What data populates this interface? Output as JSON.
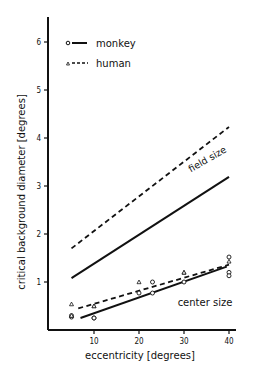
{
  "chart_data": {
    "type": "line",
    "title": "",
    "xlabel": "eccentricity  [degrees]",
    "ylabel": "critical  background  diameter  [degrees]",
    "xlim": [
      0,
      42
    ],
    "ylim": [
      0,
      6.4
    ],
    "x_ticks": [
      10,
      20,
      30,
      40
    ],
    "y_ticks": [
      1,
      2,
      3,
      4,
      5,
      6
    ],
    "grid": false,
    "legend": {
      "position": "upper left",
      "entries": [
        {
          "label": "monkey",
          "marker": "circle",
          "line": "solid"
        },
        {
          "label": "human",
          "marker": "triangle",
          "line": "dashed"
        }
      ]
    },
    "annotations": [
      {
        "text": "field size",
        "x": 35,
        "y": 3.5,
        "rotation": -27
      },
      {
        "text": "center size",
        "x": 32,
        "y": 0.7,
        "rotation": 0
      }
    ],
    "series": [
      {
        "name": "monkey field size",
        "style": "solid",
        "x": [
          5,
          40
        ],
        "y": [
          1.08,
          3.19
        ]
      },
      {
        "name": "human field size",
        "style": "dashed",
        "x": [
          5,
          40
        ],
        "y": [
          1.7,
          4.23
        ]
      },
      {
        "name": "monkey center size",
        "style": "solid",
        "x": [
          7,
          39.5
        ],
        "y": [
          0.25,
          1.32
        ]
      },
      {
        "name": "human center size",
        "style": "dashed",
        "x": [
          6.5,
          40
        ],
        "y": [
          0.45,
          1.36
        ]
      },
      {
        "name": "monkey data",
        "style": "marker-circle",
        "x": [
          5,
          5,
          10,
          10,
          20,
          23,
          23,
          30,
          40,
          40,
          40
        ],
        "y": [
          0.27,
          0.3,
          0.25,
          0.25,
          0.77,
          1.0,
          0.77,
          1.0,
          1.52,
          1.2,
          1.13
        ]
      },
      {
        "name": "human data",
        "style": "marker-triangle",
        "x": [
          5,
          5,
          10,
          10,
          20,
          30,
          30,
          40
        ],
        "y": [
          0.54,
          0.3,
          0.5,
          0.5,
          1.0,
          1.2,
          1.2,
          1.43
        ]
      }
    ]
  }
}
